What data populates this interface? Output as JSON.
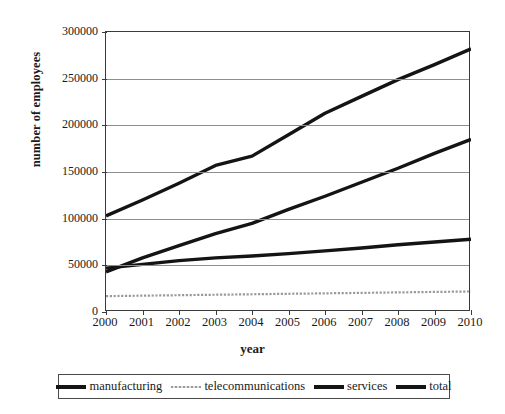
{
  "chart_data": {
    "type": "line",
    "title": "",
    "xlabel": "year",
    "ylabel": "number of employees",
    "x": [
      2000,
      2001,
      2002,
      2003,
      2004,
      2005,
      2006,
      2007,
      2008,
      2009,
      2010
    ],
    "categories": [
      "2000",
      "2001",
      "2002",
      "2003",
      "2004",
      "2005",
      "2006",
      "2007",
      "2008",
      "2009",
      "2010"
    ],
    "xlim": [
      2000,
      2010
    ],
    "ylim": [
      0,
      300000
    ],
    "yticks": [
      0,
      50000,
      100000,
      150000,
      200000,
      250000,
      300000
    ],
    "ytick_labels": [
      "0",
      "50000",
      "100000",
      "150000",
      "200000",
      "250000",
      "300000"
    ],
    "grid": "horizontal",
    "legend_position": "bottom",
    "series": [
      {
        "name": "manufacturing",
        "style": "thick-solid-black",
        "color": "#141414",
        "values": [
          43000,
          58000,
          71000,
          84000,
          95000,
          110000,
          124000,
          139000,
          154000,
          170000,
          185000
        ]
      },
      {
        "name": "telecommunications",
        "style": "thin-dotted-gray",
        "color": "#9a9a9a",
        "values": [
          17000,
          17500,
          18000,
          18500,
          19000,
          19500,
          20000,
          20500,
          21000,
          21500,
          22000
        ]
      },
      {
        "name": "services",
        "style": "thick-solid-black",
        "color": "#141414",
        "values": [
          47000,
          51000,
          55000,
          58000,
          60000,
          62500,
          65500,
          68500,
          72000,
          75000,
          78000
        ]
      },
      {
        "name": "total",
        "style": "thick-solid-black",
        "color": "#141414",
        "values": [
          103000,
          120000,
          138000,
          157000,
          167000,
          190000,
          213000,
          231000,
          249000,
          265000,
          282000
        ]
      }
    ]
  },
  "axes": {
    "ylabel": "number of employees",
    "xlabel": "year"
  },
  "legend": {
    "items": [
      {
        "label": "manufacturing",
        "swatch": "thick-line-swatch"
      },
      {
        "label": "telecommunications",
        "swatch": "thin-dotted-line-swatch"
      },
      {
        "label": "services",
        "swatch": "thick-line-swatch"
      },
      {
        "label": "total",
        "swatch": "thick-line-swatch"
      }
    ]
  }
}
